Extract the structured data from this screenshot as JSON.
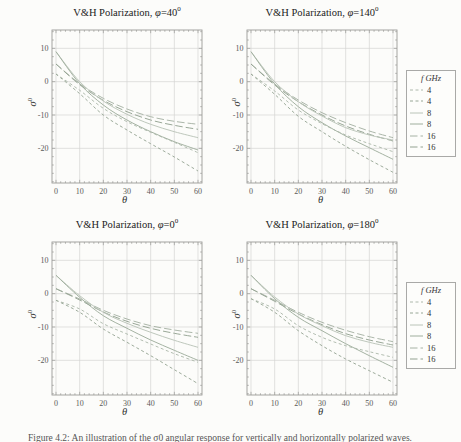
{
  "figure": {
    "axes": {
      "x_label": "θ",
      "y_label": "σ",
      "y_label_sup": "0",
      "x_ticks": [
        0,
        10,
        20,
        30,
        40,
        50,
        60
      ],
      "y_ticks": [
        10,
        0,
        -10,
        -20
      ],
      "x_range": [
        0,
        60
      ],
      "y_range": [
        -30,
        15
      ],
      "grid": true
    },
    "legend": {
      "title": "f GHz",
      "entries": [
        {
          "label": "4",
          "color": "#aeb9ac",
          "dash": "3,2.5"
        },
        {
          "label": "4",
          "color": "#98a796",
          "dash": "3,2.5"
        },
        {
          "label": "8",
          "color": "#bac4b8",
          "dash": ""
        },
        {
          "label": "8",
          "color": "#9fae9d",
          "dash": ""
        },
        {
          "label": "16",
          "color": "#a6b2a4",
          "dash": "7.5,3"
        },
        {
          "label": "16",
          "color": "#93a291",
          "dash": "7.5,3"
        }
      ]
    },
    "caption": "Figure 4.2: An illustration of the σ0 angular response for vertically and horizontally polarized waves."
  },
  "chart_data": [
    {
      "type": "line",
      "title_main": "V&H Polarization, ",
      "title_phi": "φ",
      "title_eq": "=40",
      "title_sup": "0",
      "phi_deg": 40,
      "xlabel": "θ",
      "ylabel": "σ0",
      "x": [
        0,
        10,
        20,
        30,
        40,
        50,
        60
      ],
      "series": [
        {
          "name": "16 GHz V-pol",
          "f_GHz": 16,
          "color": "#a6b2a4",
          "dash": "7.5,3",
          "values": [
            5.3,
            -0.6,
            -5.0,
            -8.2,
            -10.5,
            -11.9,
            -12.8
          ]
        },
        {
          "name": "16 GHz H-pol",
          "f_GHz": 16,
          "color": "#93a291",
          "dash": "7.5,3",
          "values": [
            5.3,
            -0.9,
            -5.6,
            -9.0,
            -11.5,
            -13.1,
            -14.3
          ]
        },
        {
          "name": "8 GHz V-pol",
          "f_GHz": 8,
          "color": "#bac4b8",
          "dash": "",
          "values": [
            9.0,
            0.0,
            -5.8,
            -9.8,
            -12.8,
            -15.0,
            -16.8
          ]
        },
        {
          "name": "8 GHz H-pol",
          "f_GHz": 8,
          "color": "#9fae9d",
          "dash": "",
          "values": [
            9.0,
            -0.6,
            -7.0,
            -11.5,
            -15.0,
            -18.0,
            -20.5
          ]
        },
        {
          "name": "4 GHz V-pol",
          "f_GHz": 4,
          "color": "#aeb9ac",
          "dash": "3,2.5",
          "values": [
            2.3,
            -2.6,
            -8.0,
            -12.0,
            -15.2,
            -18.2,
            -21.3
          ]
        },
        {
          "name": "4 GHz H-pol",
          "f_GHz": 4,
          "color": "#98a796",
          "dash": "3,2.5",
          "values": [
            2.3,
            -3.6,
            -10.0,
            -14.5,
            -18.6,
            -22.6,
            -26.8
          ]
        }
      ]
    },
    {
      "type": "line",
      "title_main": "V&H Polarization, ",
      "title_phi": "φ",
      "title_eq": "=140",
      "title_sup": "0",
      "phi_deg": 140,
      "xlabel": "θ",
      "ylabel": "σ0",
      "x": [
        0,
        10,
        20,
        30,
        40,
        50,
        60
      ],
      "series": [
        {
          "name": "16 GHz V-pol",
          "f_GHz": 16,
          "color": "#a6b2a4",
          "dash": "7.5,3",
          "values": [
            5.3,
            -0.7,
            -5.5,
            -9.3,
            -12.3,
            -14.8,
            -16.8
          ]
        },
        {
          "name": "16 GHz H-pol",
          "f_GHz": 16,
          "color": "#93a291",
          "dash": "7.5,3",
          "values": [
            5.3,
            -1.0,
            -6.0,
            -10.0,
            -13.3,
            -15.8,
            -17.8
          ]
        },
        {
          "name": "8 GHz V-pol",
          "f_GHz": 8,
          "color": "#bac4b8",
          "dash": "",
          "values": [
            9.0,
            0.0,
            -6.0,
            -10.3,
            -13.8,
            -16.0,
            -17.5
          ]
        },
        {
          "name": "8 GHz H-pol",
          "f_GHz": 8,
          "color": "#9fae9d",
          "dash": "",
          "values": [
            9.0,
            -0.7,
            -7.5,
            -12.3,
            -16.3,
            -19.8,
            -23.3
          ]
        },
        {
          "name": "4 GHz V-pol",
          "f_GHz": 4,
          "color": "#aeb9ac",
          "dash": "3,2.5",
          "values": [
            2.3,
            -2.8,
            -8.5,
            -12.6,
            -16.0,
            -18.6,
            -21.0
          ]
        },
        {
          "name": "4 GHz H-pol",
          "f_GHz": 4,
          "color": "#98a796",
          "dash": "3,2.5",
          "values": [
            2.3,
            -3.8,
            -10.4,
            -15.0,
            -19.4,
            -23.4,
            -27.2
          ]
        }
      ]
    },
    {
      "type": "line",
      "title_main": "V&H Polarization, ",
      "title_phi": "φ",
      "title_eq": "=0",
      "title_sup": "0",
      "phi_deg": 0,
      "xlabel": "θ",
      "ylabel": "σ0",
      "x": [
        0,
        10,
        20,
        30,
        40,
        50,
        60
      ],
      "series": [
        {
          "name": "16 GHz V-pol",
          "f_GHz": 16,
          "color": "#a6b2a4",
          "dash": "7.5,3",
          "values": [
            1.5,
            -1.6,
            -5.0,
            -7.6,
            -9.6,
            -10.9,
            -11.9
          ]
        },
        {
          "name": "16 GHz H-pol",
          "f_GHz": 16,
          "color": "#93a291",
          "dash": "7.5,3",
          "values": [
            1.5,
            -1.9,
            -5.5,
            -8.3,
            -10.4,
            -11.9,
            -13.1
          ]
        },
        {
          "name": "8 GHz V-pol",
          "f_GHz": 8,
          "color": "#bac4b8",
          "dash": "",
          "values": [
            5.5,
            -0.6,
            -5.6,
            -8.9,
            -11.6,
            -14.0,
            -16.1
          ]
        },
        {
          "name": "8 GHz H-pol",
          "f_GHz": 8,
          "color": "#9fae9d",
          "dash": "",
          "values": [
            5.5,
            -1.1,
            -6.6,
            -10.4,
            -13.9,
            -17.0,
            -20.0
          ]
        },
        {
          "name": "4 GHz V-pol",
          "f_GHz": 4,
          "color": "#aeb9ac",
          "dash": "3,2.5",
          "values": [
            -2.0,
            -4.6,
            -9.0,
            -12.1,
            -15.1,
            -18.0,
            -20.6
          ]
        },
        {
          "name": "4 GHz H-pol",
          "f_GHz": 4,
          "color": "#98a796",
          "dash": "3,2.5",
          "values": [
            -2.0,
            -5.6,
            -10.6,
            -14.6,
            -18.6,
            -22.8,
            -27.0
          ]
        }
      ]
    },
    {
      "type": "line",
      "title_main": "V&H Polarization, ",
      "title_phi": "φ",
      "title_eq": "=180",
      "title_sup": "0",
      "phi_deg": 180,
      "xlabel": "θ",
      "ylabel": "σ0",
      "x": [
        0,
        10,
        20,
        30,
        40,
        50,
        60
      ],
      "series": [
        {
          "name": "16 GHz V-pol",
          "f_GHz": 16,
          "color": "#a6b2a4",
          "dash": "7.5,3",
          "values": [
            1.5,
            -2.0,
            -5.6,
            -8.6,
            -11.0,
            -12.9,
            -14.4
          ]
        },
        {
          "name": "16 GHz H-pol",
          "f_GHz": 16,
          "color": "#93a291",
          "dash": "7.5,3",
          "values": [
            1.5,
            -2.3,
            -6.1,
            -9.3,
            -12.0,
            -13.9,
            -15.4
          ]
        },
        {
          "name": "8 GHz V-pol",
          "f_GHz": 8,
          "color": "#bac4b8",
          "dash": "",
          "values": [
            5.5,
            -1.0,
            -6.1,
            -9.6,
            -12.6,
            -14.6,
            -16.1
          ]
        },
        {
          "name": "8 GHz H-pol",
          "f_GHz": 8,
          "color": "#9fae9d",
          "dash": "",
          "values": [
            5.5,
            -1.5,
            -7.1,
            -11.1,
            -15.0,
            -18.6,
            -22.1
          ]
        },
        {
          "name": "4 GHz V-pol",
          "f_GHz": 4,
          "color": "#aeb9ac",
          "dash": "3,2.5",
          "values": [
            -1.5,
            -4.6,
            -9.6,
            -13.1,
            -15.6,
            -17.4,
            -19.1
          ]
        },
        {
          "name": "4 GHz H-pol",
          "f_GHz": 4,
          "color": "#98a796",
          "dash": "3,2.5",
          "values": [
            -1.5,
            -5.6,
            -11.1,
            -15.6,
            -19.6,
            -23.1,
            -26.6
          ]
        }
      ]
    }
  ]
}
